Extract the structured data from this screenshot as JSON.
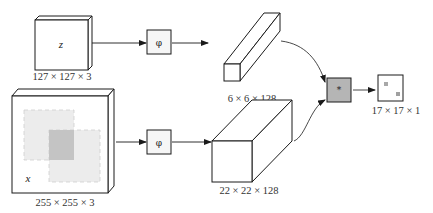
{
  "diagram": {
    "type": "siamese-network",
    "inputs": {
      "exemplar": {
        "variable": "z",
        "size_label": "127 × 127 × 3"
      },
      "search": {
        "variable": "x",
        "size_label": "255 × 255 × 3"
      }
    },
    "embedding": {
      "top": {
        "symbol": "φ"
      },
      "bottom": {
        "symbol": "φ"
      }
    },
    "features": {
      "top": {
        "size_label": "6 × 6 × 128"
      },
      "bottom": {
        "size_label": "22 × 22 × 128"
      }
    },
    "correlation": {
      "symbol": "*"
    },
    "output": {
      "size_label": "17 × 17 × 1"
    },
    "colors": {
      "stroke": "#1a1a1a",
      "correlation_fill": "#b5b5b5",
      "score_marker": "#a8a8a8",
      "window_light": "#e8e8e8",
      "window_dark": "#bdbdbd",
      "window_dash": "#c9c9c9"
    }
  }
}
